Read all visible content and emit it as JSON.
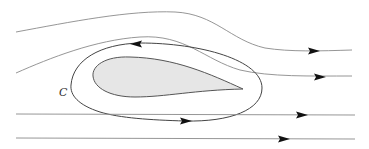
{
  "diagram": {
    "contour_label": "C",
    "colors": {
      "background": "#ffffff",
      "airfoil_fill": "#e6e6e6",
      "airfoil_stroke": "#555555",
      "contour_stroke": "#444444",
      "streamline_stroke": "#8a8a8a",
      "arrow": "#111111"
    },
    "elements": [
      {
        "id": "streamline-1",
        "type": "streamline",
        "direction": "right"
      },
      {
        "id": "streamline-2",
        "type": "streamline",
        "direction": "right"
      },
      {
        "id": "streamline-3",
        "type": "streamline",
        "direction": "right"
      },
      {
        "id": "streamline-4",
        "type": "streamline",
        "direction": "right"
      },
      {
        "id": "airfoil",
        "type": "body"
      },
      {
        "id": "contour-C",
        "type": "closed-contour",
        "direction": "clockwise",
        "label": "C"
      }
    ]
  }
}
